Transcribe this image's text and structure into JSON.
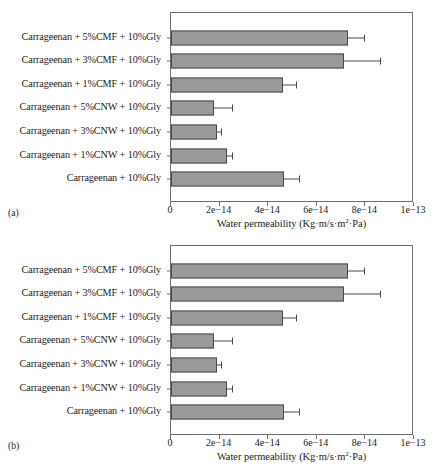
{
  "figure": {
    "panels": [
      {
        "tag": "(a)"
      },
      {
        "tag": "(b)"
      }
    ]
  },
  "chart_data": {
    "type": "bar",
    "orientation": "horizontal",
    "title": "",
    "xlabel": "Water permeability (Kg·m/s·m²·Pa)",
    "xlabel_parts": {
      "before": "Water permeability (Kg·m/s·m",
      "sup": "2",
      "after": "·Pa)"
    },
    "ylabel": "",
    "xlim": [
      0,
      1e-13
    ],
    "grid": false,
    "legend": false,
    "bar_color": "#9a9a9a",
    "bar_edge_color": "#4a4a4a",
    "xticks": [
      0,
      2e-14,
      4e-14,
      6e-14,
      8e-14,
      1e-13
    ],
    "xticklabels": [
      "0",
      "2e−14",
      "4e−14",
      "6e−14",
      "8e−14",
      "1e−13"
    ],
    "categories": [
      "Carrageenan + 5%CMF + 10%Gly",
      "Carrageenan + 3%CMF + 10%Gly",
      "Carrageenan + 1%CMF + 10%Gly",
      "Carrageenan + 5%CNW + 10%Gly",
      "Carrageenan + 3%CNW + 10%Gly",
      "Carrageenan + 1%CNW + 10%Gly",
      "Carrageenan + 10%Gly"
    ],
    "values": [
      7.3e-14,
      7.1e-14,
      4.6e-14,
      1.75e-14,
      1.9e-14,
      2.3e-14,
      4.65e-14
    ],
    "errors_pos": [
      6.5e-15,
      1.5e-14,
      5.5e-15,
      7.5e-15,
      1.5e-15,
      2e-15,
      6e-15
    ],
    "panels": [
      {
        "tag": "(a)",
        "values": [
          7.3e-14,
          7.1e-14,
          4.6e-14,
          1.75e-14,
          1.9e-14,
          2.3e-14,
          4.65e-14
        ],
        "errors_pos": [
          6.5e-15,
          1.5e-14,
          5.5e-15,
          7.5e-15,
          1.5e-15,
          2e-15,
          6e-15
        ]
      },
      {
        "tag": "(b)",
        "values": [
          7.3e-14,
          7.1e-14,
          4.6e-14,
          1.75e-14,
          1.9e-14,
          2.3e-14,
          4.65e-14
        ],
        "errors_pos": [
          6.5e-15,
          1.5e-14,
          5.5e-15,
          7.5e-15,
          1.5e-15,
          2e-15,
          6e-15
        ]
      }
    ]
  }
}
